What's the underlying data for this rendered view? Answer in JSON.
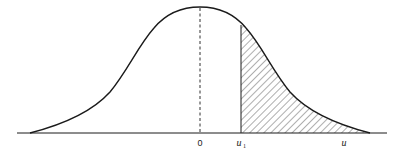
{
  "diagram": {
    "type": "normal-distribution-curve",
    "labels": {
      "origin": "0",
      "u1_main": "u",
      "u1_sub": "1",
      "u": "u"
    },
    "colors": {
      "stroke": "#1a1a1a",
      "hatch": "#333333",
      "background": "#ffffff"
    },
    "geometry": {
      "axis_y": 133,
      "axis_x_start": 17,
      "axis_x_end": 387,
      "peak_x": 200,
      "peak_y": 7,
      "u1_x": 241,
      "u_x": 344
    }
  }
}
